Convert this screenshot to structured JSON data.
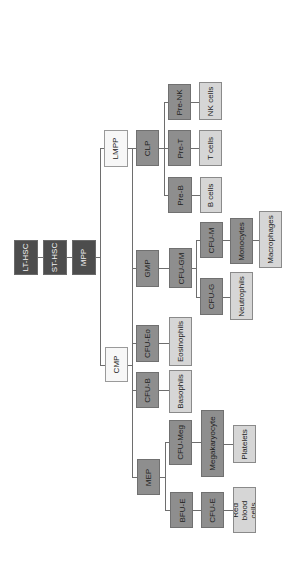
{
  "diagram": {
    "orientation": "rotated-90-ccw",
    "colors": {
      "stem": "#4d4d4d",
      "progenitor": "#8e8e8e",
      "mature": "#d6d6d6",
      "branch": "#f7f7f7"
    },
    "nodes": {
      "lt_hsc": "LT-HSC",
      "st_hsc": "ST-HSC",
      "mpp": "MPP",
      "lmpp": "LMPP",
      "cmp": "CMP",
      "clp": "CLP",
      "gmp": "GMP",
      "cfu_eo": "CFU-Eo",
      "cfu_b": "CFU-B",
      "mep": "MEP",
      "pre_nk": "Pre-NK",
      "pre_t": "Pre-T",
      "pre_b": "Pre-B",
      "cfu_gm": "CFU-GM",
      "cfu_m": "CFU-M",
      "cfu_g": "CFU-G",
      "cfu_meg": "CFU-Meg",
      "bfu_e": "BFU-E",
      "cfu_e": "CFU-E",
      "nk_cells": "NK cells",
      "t_cells": "T cells",
      "b_cells": "B cells",
      "monocytes": "Monocytes",
      "macrophages": "Macrophages",
      "neutrophils": "Neutrophils",
      "eosinophils": "Eosinophils",
      "basophils": "Basophils",
      "megakaryocyte": "Megakaryocyte",
      "platelets": "Platelets",
      "red_blood_cells": "Red blood cells"
    },
    "edges": [
      [
        "LT-HSC",
        "ST-HSC"
      ],
      [
        "ST-HSC",
        "MPP"
      ],
      [
        "MPP",
        "LMPP"
      ],
      [
        "MPP",
        "CMP"
      ],
      [
        "LMPP",
        "CLP"
      ],
      [
        "LMPP",
        "GMP"
      ],
      [
        "CMP",
        "GMP"
      ],
      [
        "CMP",
        "CFU-Eo"
      ],
      [
        "CMP",
        "CFU-B"
      ],
      [
        "CMP",
        "MEP"
      ],
      [
        "CLP",
        "Pre-NK"
      ],
      [
        "CLP",
        "Pre-T"
      ],
      [
        "CLP",
        "Pre-B"
      ],
      [
        "Pre-NK",
        "NK cells"
      ],
      [
        "Pre-T",
        "T cells"
      ],
      [
        "Pre-B",
        "B cells"
      ],
      [
        "GMP",
        "CFU-GM"
      ],
      [
        "CFU-GM",
        "CFU-M"
      ],
      [
        "CFU-GM",
        "CFU-G"
      ],
      [
        "CFU-M",
        "Monocytes"
      ],
      [
        "Monocytes",
        "Macrophages"
      ],
      [
        "CFU-G",
        "Neutrophils"
      ],
      [
        "CFU-Eo",
        "Eosinophils"
      ],
      [
        "CFU-B",
        "Basophils"
      ],
      [
        "MEP",
        "CFU-Meg"
      ],
      [
        "MEP",
        "BFU-E"
      ],
      [
        "CFU-Meg",
        "Megakaryocyte"
      ],
      [
        "Megakaryocyte",
        "Platelets"
      ],
      [
        "BFU-E",
        "CFU-E"
      ],
      [
        "CFU-E",
        "Red blood cells"
      ]
    ]
  }
}
